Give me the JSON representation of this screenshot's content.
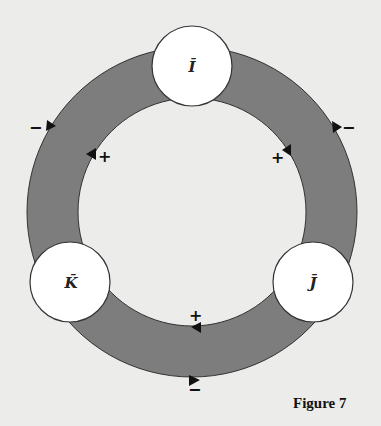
{
  "figure": {
    "caption": "Figure 7",
    "colors": {
      "background": "#ececea",
      "band": "#7d7d7d",
      "node_fill": "#ffffff",
      "stroke": "#333333",
      "arrow": "#111111"
    },
    "nodes": [
      {
        "id": "I",
        "label": "Ī",
        "position": "top"
      },
      {
        "id": "K",
        "label": "K̄",
        "position": "bottom-left"
      },
      {
        "id": "J",
        "label": "J̄",
        "position": "bottom-right"
      }
    ],
    "signs": {
      "left_outer": "−",
      "left_inner": "+",
      "right_outer": "−",
      "right_inner": "+",
      "bottom_inner": "+",
      "bottom_outer": "−"
    }
  }
}
